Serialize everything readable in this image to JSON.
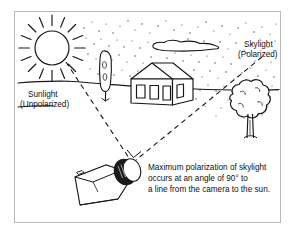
{
  "figure": {
    "title_alt": "Maximum polarization of skylight diagram",
    "frame": {
      "border_color": "#b9b9b9",
      "background_color": "#ffffff"
    },
    "ink_color": "#151515",
    "stipple_color": "#4a4a4a"
  },
  "labels": {
    "sunlight": {
      "line1": "Sunlight",
      "line2": "(Unpolarized)"
    },
    "skylight": {
      "line1": "Skylight",
      "line2": "(Polarized)"
    },
    "caption": {
      "line1": "Maximum polarization of skylight",
      "line2": "occurs at an angle of 90° to",
      "line3": "a line from the camera to the sun."
    }
  },
  "scene_objects": {
    "sun": "sun-with-rays",
    "cloud": "cloud",
    "house": "house",
    "tree_left": "cypress-tree",
    "tree_right": "deciduous-tree",
    "camera": "camera-with-lens",
    "ray_sunlight": "dashed-ray-sun-to-camera",
    "ray_skylight": "dashed-ray-sky-to-camera",
    "angle_marker": "right-angle-90-degrees"
  }
}
